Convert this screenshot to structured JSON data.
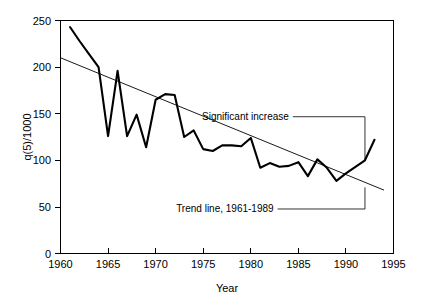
{
  "chart_data": {
    "type": "line",
    "title": "",
    "xlabel": "Year",
    "ylabel": "q(5)/1000",
    "xlim": [
      1960,
      1995
    ],
    "ylim": [
      0,
      250
    ],
    "grid": false,
    "legend_position": "none",
    "x_ticks": [
      "1960",
      "1965",
      "1970",
      "1975",
      "1980",
      "1985",
      "1990",
      "1995"
    ],
    "x_tick_values": [
      1960,
      1965,
      1970,
      1975,
      1980,
      1985,
      1990,
      1995
    ],
    "y_ticks": [
      "0",
      "50",
      "100",
      "150",
      "200",
      "250"
    ],
    "y_tick_values": [
      0,
      50,
      100,
      150,
      200,
      250
    ],
    "series": [
      {
        "name": "q(5)/1000",
        "style": "thick-solid-black",
        "x": [
          1961,
          1962,
          1963,
          1964,
          1965,
          1966,
          1967,
          1968,
          1969,
          1970,
          1971,
          1972,
          1973,
          1974,
          1975,
          1976,
          1977,
          1978,
          1979,
          1980,
          1981,
          1982,
          1983,
          1984,
          1985,
          1986,
          1987,
          1988,
          1989,
          1990,
          1991,
          1992,
          1993
        ],
        "values": [
          243,
          228,
          214,
          200,
          126,
          196,
          126,
          149,
          114,
          165,
          171,
          170,
          125,
          132,
          112,
          110,
          116,
          116,
          115,
          124,
          92,
          97,
          93,
          94,
          98,
          83,
          101,
          92,
          78,
          86,
          93,
          100,
          122
        ]
      },
      {
        "name": "Trend line, 1961-1989",
        "style": "thin-solid-black",
        "x": [
          1960,
          1994
        ],
        "values": [
          210,
          68
        ]
      }
    ],
    "annotations": [
      {
        "text": "Significant increase",
        "points_to_x": 1992,
        "points_to_y": 100,
        "label_x": 1984.0,
        "label_y": 143
      },
      {
        "text": "Trend line, 1961-1989",
        "points_to_x": 1992,
        "points_to_y": 71,
        "label_x": 1982.4,
        "label_y": 44
      }
    ]
  },
  "axes": {
    "x_axis_title": "Year",
    "y_axis_title": "q(5)/1000"
  }
}
